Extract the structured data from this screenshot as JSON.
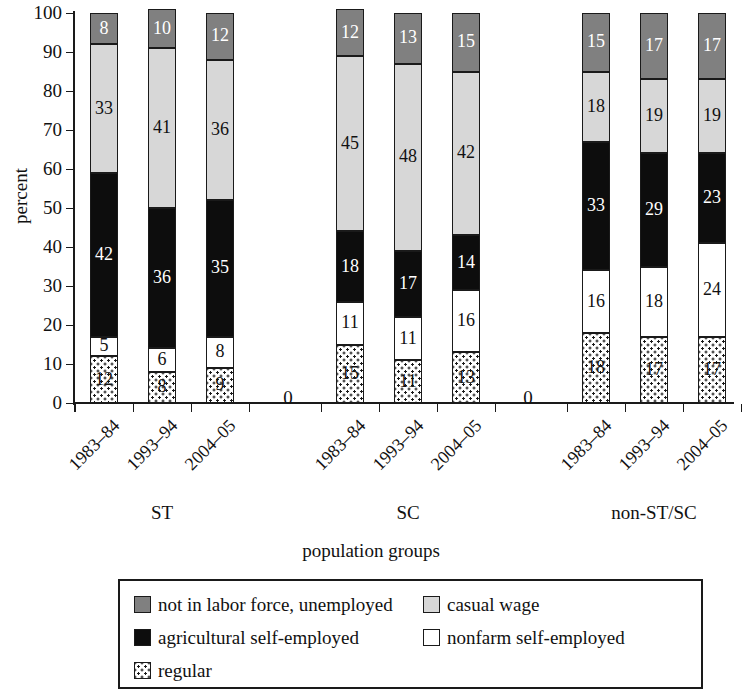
{
  "chart_data": {
    "type": "bar",
    "subtype": "stacked-bar-100",
    "title": "",
    "xlabel": "population groups",
    "ylabel": "percent",
    "ylim": [
      0,
      100
    ],
    "yticks": [
      0,
      10,
      20,
      30,
      40,
      50,
      60,
      70,
      80,
      90,
      100
    ],
    "grid": false,
    "legend_position": "bottom",
    "group_labels": [
      "ST",
      "SC",
      "non-ST/SC"
    ],
    "group_separator_label": "0",
    "categories": [
      "1983–84",
      "1993–94",
      "2004–05",
      "1983–84",
      "1993–94",
      "2004–05",
      "1983–84",
      "1993–94",
      "2004–05"
    ],
    "series": [
      {
        "name": "regular",
        "fill": "dotted",
        "color": "#ffffff",
        "values": [
          12,
          8,
          9,
          15,
          11,
          13,
          18,
          17,
          17
        ]
      },
      {
        "name": "nonfarm self-employed",
        "fill": "solid",
        "color": "#ffffff",
        "values": [
          5,
          6,
          8,
          11,
          11,
          16,
          16,
          18,
          24
        ]
      },
      {
        "name": "agricultural self-employed",
        "fill": "solid",
        "color": "#0d0d0d",
        "values": [
          42,
          36,
          35,
          18,
          17,
          14,
          33,
          29,
          23
        ]
      },
      {
        "name": "casual wage",
        "fill": "solid",
        "color": "#d7d7d7",
        "values": [
          33,
          41,
          36,
          45,
          48,
          42,
          18,
          19,
          19
        ]
      },
      {
        "name": "not in labor force, unemployed",
        "fill": "solid",
        "color": "#808080",
        "values": [
          8,
          10,
          12,
          12,
          13,
          15,
          15,
          17,
          17
        ]
      }
    ]
  },
  "legend": {
    "items": [
      {
        "label": "not in labor force, unemployed",
        "swatch": "gray-dark-swatch"
      },
      {
        "label": "casual wage",
        "swatch": "gray-light-swatch"
      },
      {
        "label": "agricultural self-employed",
        "swatch": "black-swatch"
      },
      {
        "label": "nonfarm self-employed",
        "swatch": "white-swatch"
      },
      {
        "label": "regular",
        "swatch": "dotted-swatch"
      }
    ]
  },
  "axes": {
    "y_title": "percent",
    "x_title": "population groups"
  }
}
